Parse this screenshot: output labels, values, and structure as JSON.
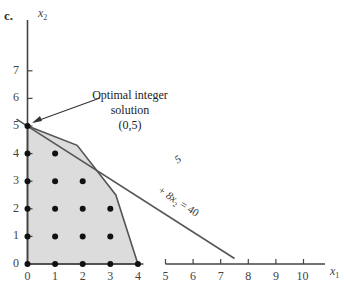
{
  "panel_label": "c.",
  "chart_data": {
    "type": "scatter",
    "title": "",
    "xlabel": "x1",
    "ylabel": "x2",
    "xlim": [
      0,
      10
    ],
    "ylim": [
      0,
      7
    ],
    "x_ticks": [
      "0",
      "1",
      "2",
      "3",
      "4",
      "5",
      "6",
      "7",
      "8",
      "9",
      "10"
    ],
    "y_ticks": [
      "0",
      "1",
      "2",
      "3",
      "4",
      "5",
      "6",
      "7"
    ],
    "grid": false,
    "feasible_region": {
      "vertices": [
        [
          0,
          0
        ],
        [
          0,
          5
        ],
        [
          1.8,
          4.3
        ],
        [
          3.2,
          2.5
        ],
        [
          4,
          0
        ]
      ],
      "fill": "#dcdcdc"
    },
    "objective_line": {
      "label": "5x1 + 8x2 = 40",
      "visible_label_parts": [
        "5",
        "+ 8x2 = 40"
      ],
      "from": [
        -0.4,
        5.25
      ],
      "to": [
        7.5,
        0.2
      ]
    },
    "integer_points": [
      [
        0,
        0
      ],
      [
        1,
        0
      ],
      [
        2,
        0
      ],
      [
        3,
        0
      ],
      [
        4,
        0
      ],
      [
        0,
        1
      ],
      [
        1,
        1
      ],
      [
        2,
        1
      ],
      [
        3,
        1
      ],
      [
        0,
        2
      ],
      [
        1,
        2
      ],
      [
        2,
        2
      ],
      [
        3,
        2
      ],
      [
        0,
        3
      ],
      [
        1,
        3
      ],
      [
        2,
        3
      ],
      [
        0,
        4
      ],
      [
        1,
        4
      ],
      [
        0,
        5
      ]
    ],
    "annotations": [
      {
        "text": "Optimal integer solution (0,5)",
        "point": [
          0,
          5
        ]
      }
    ]
  },
  "labels": {
    "x_axis": "x",
    "x_axis_sub": "1",
    "y_axis": "x",
    "y_axis_sub": "2",
    "annotation_line1": "Optimal integer",
    "annotation_line2": "solution",
    "annotation_line3": "(0,5)",
    "line_label_a": "5",
    "line_label_b": "+ 8x",
    "line_label_b_sub": "2",
    "line_label_c": " = 40"
  }
}
